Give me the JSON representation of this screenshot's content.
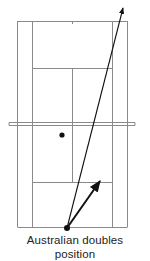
{
  "diagram": {
    "type": "tennis-court-half-plan",
    "caption_lines": [
      "Australian doubles",
      "position"
    ],
    "colors": {
      "court_lines": "#8a8a8a",
      "arrows": "#111111",
      "player_dots": "#111111",
      "background": "#ffffff"
    },
    "elements": {
      "net": "double horizontal line across court",
      "partner_dot": "player at net side, left of center",
      "server_dot": "server at baseline near center mark",
      "long_arrow": "serve direction toward far deep court",
      "short_arrow": "server movement toward right service box"
    }
  }
}
